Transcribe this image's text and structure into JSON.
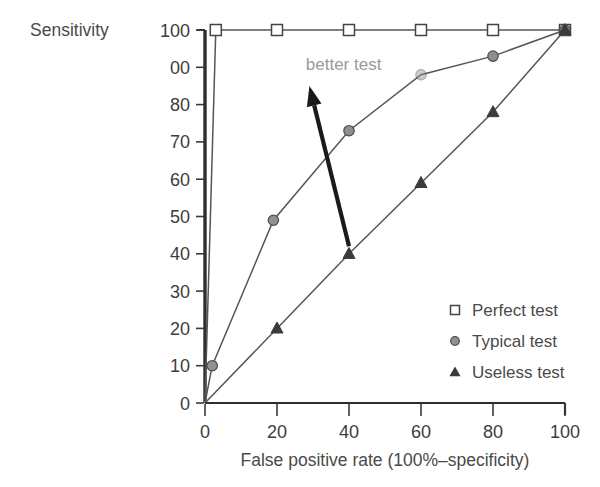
{
  "chart_data": {
    "type": "line",
    "title": "",
    "ylabel": "Sensitivity",
    "xlabel": "False positive rate (100%–specificity)",
    "xlim": [
      0,
      100
    ],
    "ylim": [
      0,
      100
    ],
    "grid": false,
    "legend_position": "inside-lower-right",
    "x_ticks": [
      0,
      20,
      40,
      60,
      80,
      100
    ],
    "x_tick_labels": [
      "0",
      "20",
      "40",
      "60",
      "80",
      "100"
    ],
    "y_ticks": [
      0,
      10,
      20,
      30,
      40,
      50,
      60,
      70,
      80,
      90,
      100
    ],
    "y_tick_labels": [
      "0",
      "10",
      "20",
      "30",
      "40",
      "50",
      "60",
      "70",
      "80",
      "00",
      "100"
    ],
    "annotations": [
      {
        "text": "better test",
        "x": 28,
        "y": 91,
        "arrow_from": [
          40,
          42
        ],
        "arrow_to": [
          29,
          85
        ]
      }
    ],
    "series": [
      {
        "name": "Perfect test",
        "marker": "open-square",
        "color": "#444444",
        "points": [
          {
            "x": 0,
            "y": 0
          },
          {
            "x": 3,
            "y": 100
          },
          {
            "x": 20,
            "y": 100
          },
          {
            "x": 40,
            "y": 100
          },
          {
            "x": 60,
            "y": 100
          },
          {
            "x": 80,
            "y": 100
          },
          {
            "x": 100,
            "y": 100
          }
        ]
      },
      {
        "name": "Typical test",
        "marker": "filled-circle",
        "color": "#909090",
        "points": [
          {
            "x": 0,
            "y": 0
          },
          {
            "x": 2,
            "y": 10
          },
          {
            "x": 19,
            "y": 49
          },
          {
            "x": 40,
            "y": 73
          },
          {
            "x": 60,
            "y": 88
          },
          {
            "x": 80,
            "y": 93
          },
          {
            "x": 100,
            "y": 100
          }
        ]
      },
      {
        "name": "Useless test",
        "marker": "filled-triangle",
        "color": "#3b3b3b",
        "points": [
          {
            "x": 0,
            "y": 0
          },
          {
            "x": 20,
            "y": 20
          },
          {
            "x": 40,
            "y": 40
          },
          {
            "x": 60,
            "y": 59
          },
          {
            "x": 80,
            "y": 78
          },
          {
            "x": 100,
            "y": 100
          }
        ]
      }
    ],
    "legend": [
      {
        "label": "Perfect test",
        "marker": "open-square"
      },
      {
        "label": "Typical test",
        "marker": "filled-circle"
      },
      {
        "label": "Useless test",
        "marker": "filled-triangle"
      }
    ]
  },
  "colors": {
    "axis": "#2e2e2e",
    "text": "#3d3d3d",
    "perfect": "#444444",
    "typical": "#909090",
    "useless": "#3b3b3b",
    "arrow": "#1a1a1a",
    "annotation": "#9a9a9a",
    "background": "#ffffff"
  }
}
